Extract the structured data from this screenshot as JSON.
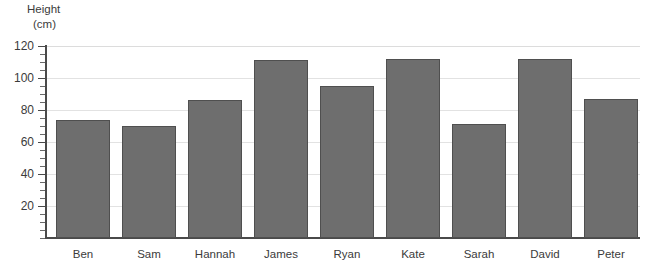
{
  "chart_data": {
    "type": "bar",
    "title": "",
    "xlabel": "",
    "ylabel": "Height (cm)",
    "ylabel_line1": "Height",
    "ylabel_line2": "(cm)",
    "categories": [
      "Ben",
      "Sam",
      "Hannah",
      "James",
      "Ryan",
      "Kate",
      "Sarah",
      "David",
      "Peter"
    ],
    "values": [
      74,
      70,
      86,
      111,
      95,
      112,
      71,
      112,
      87
    ],
    "ylim": [
      0,
      120
    ],
    "ytick_labels": [
      "120",
      "100",
      "80",
      "60",
      "40",
      "20"
    ],
    "ytick_values": [
      120,
      100,
      80,
      60,
      40,
      20
    ],
    "ymajor_step": 20,
    "yminor_step": 5,
    "grid": "horizontal",
    "legend": "none",
    "series_name": "Height",
    "bar_color": "#6e6e6e",
    "bar_border_color": "#4f4f4f",
    "grid_color": "#e2e2e2",
    "axis_color": "#4a4a4a",
    "background": "#ffffff"
  }
}
